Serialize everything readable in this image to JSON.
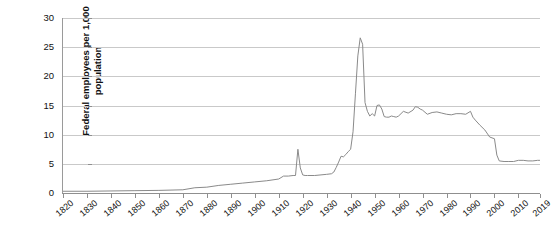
{
  "chart": {
    "type": "line",
    "title": "",
    "ylabel_line1": "Federal employees per 1,000",
    "ylabel_line2": "population",
    "xlabel": "",
    "line_color": "#8a8a8a",
    "grid_color": "#c9c9c9",
    "axis_color": "#8f8f8f",
    "background": "#ffffff"
  },
  "axes": {
    "y_ticks": [
      "0",
      "5",
      "10",
      "15",
      "20",
      "25",
      "30"
    ],
    "y_min": 0,
    "y_max": 30,
    "x_ticks": [
      "1820",
      "1830",
      "1840",
      "1850",
      "1860",
      "1870",
      "1880",
      "1890",
      "1900",
      "1910",
      "1920",
      "1930",
      "1940",
      "1950",
      "1960",
      "1970",
      "1980",
      "1990",
      "2000",
      "2010",
      "2019"
    ],
    "x_min": 1820,
    "x_max": 2019,
    "grid": true,
    "legend": "none"
  },
  "chart_data": {
    "type": "line",
    "title": "",
    "xlabel": "",
    "ylabel": "Federal employees per 1,000 population",
    "ylim": [
      0,
      30
    ],
    "xlim": [
      1820,
      2019
    ],
    "grid": true,
    "legend_position": "none",
    "series": [
      {
        "name": "Federal employees per 1,000 population",
        "x": [
          1820,
          1830,
          1840,
          1850,
          1860,
          1870,
          1875,
          1880,
          1885,
          1890,
          1895,
          1900,
          1905,
          1910,
          1912,
          1914,
          1916,
          1917,
          1918,
          1919,
          1920,
          1921,
          1922,
          1925,
          1930,
          1932,
          1933,
          1934,
          1935,
          1936,
          1937,
          1938,
          1939,
          1940,
          1941,
          1942,
          1943,
          1944,
          1945,
          1946,
          1947,
          1948,
          1949,
          1950,
          1951,
          1952,
          1953,
          1954,
          1955,
          1956,
          1957,
          1958,
          1959,
          1960,
          1962,
          1964,
          1966,
          1967,
          1968,
          1969,
          1970,
          1972,
          1974,
          1976,
          1978,
          1980,
          1982,
          1984,
          1986,
          1988,
          1990,
          1991,
          1992,
          1994,
          1996,
          1998,
          2000,
          2001,
          2002,
          2004,
          2006,
          2008,
          2010,
          2012,
          2014,
          2016,
          2018,
          2019
        ],
        "y": [
          0.3,
          0.3,
          0.35,
          0.4,
          0.45,
          0.55,
          0.9,
          1.0,
          1.3,
          1.5,
          1.7,
          1.9,
          2.1,
          2.4,
          2.9,
          2.9,
          3.0,
          3.0,
          7.5,
          4.3,
          3.1,
          3.0,
          3.0,
          3.0,
          3.2,
          3.3,
          3.6,
          4.4,
          5.3,
          6.3,
          6.2,
          6.6,
          7.1,
          7.5,
          10.5,
          17.0,
          23.5,
          26.6,
          25.5,
          15.5,
          14.0,
          13.2,
          13.6,
          13.2,
          15.0,
          15.1,
          14.4,
          13.1,
          13.0,
          13.0,
          13.2,
          13.1,
          13.0,
          13.2,
          14.0,
          13.7,
          14.2,
          14.8,
          14.7,
          14.4,
          14.2,
          13.5,
          13.8,
          13.9,
          13.7,
          13.5,
          13.4,
          13.6,
          13.6,
          13.5,
          14.0,
          13.0,
          12.5,
          11.6,
          10.8,
          9.6,
          9.3,
          6.5,
          5.5,
          5.4,
          5.4,
          5.4,
          5.6,
          5.6,
          5.5,
          5.5,
          5.6,
          5.6
        ]
      }
    ]
  }
}
